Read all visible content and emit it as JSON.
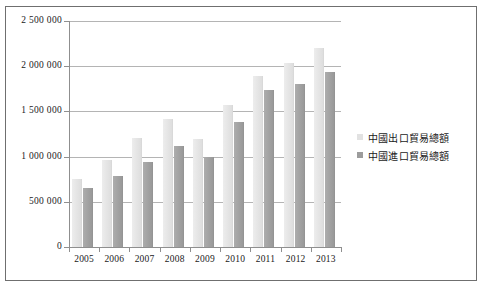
{
  "chart_data": {
    "type": "bar",
    "title": "",
    "xlabel": "",
    "ylabel": "",
    "categories": [
      "2005",
      "2006",
      "2007",
      "2008",
      "2009",
      "2010",
      "2011",
      "2012",
      "2013"
    ],
    "series": [
      {
        "name": "中國出口貿易總額",
        "color": "#e2e2e2",
        "values": [
          762000,
          969000,
          1220000,
          1431000,
          1202000,
          1578000,
          1899000,
          2049000,
          2210000
        ]
      },
      {
        "name": "中國進口貿易總額",
        "color": "#9c9c9c",
        "values": [
          660000,
          792000,
          956000,
          1133000,
          1006000,
          1396000,
          1743000,
          1818000,
          1950000
        ]
      }
    ],
    "ylim": [
      0,
      2500000
    ],
    "ytick_values": [
      0,
      500000,
      1000000,
      1500000,
      2000000,
      2500000
    ],
    "ytick_labels": [
      "0",
      "500 000",
      "1 000 000",
      "1 500 000",
      "2 000 000",
      "2 500 000"
    ],
    "grid": true,
    "legend_position": "right"
  },
  "legend": {
    "items": [
      {
        "label": "中國出口貿易總額"
      },
      {
        "label": "中國進口貿易總額"
      }
    ]
  }
}
